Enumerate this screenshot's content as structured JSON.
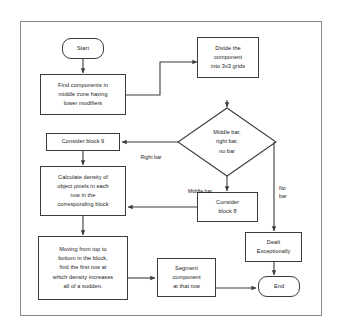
{
  "diagram": {
    "type": "flowchart",
    "border_color": "#8a8a8a",
    "node_border_color": "#3c3c3c",
    "background": "#ffffff",
    "nodes": {
      "start": {
        "label": "Start",
        "shape": "terminator"
      },
      "find_components": {
        "label": "Find components in\nmiddle zone having\nlower modifiers",
        "shape": "process"
      },
      "divide": {
        "label": "Divide the\ncomponent\ninto 3x3 grids",
        "shape": "process"
      },
      "decision": {
        "label": "Middle bar,\nright bar,\nno bar",
        "shape": "decision"
      },
      "consider_block_9": {
        "label": "Consider block 9",
        "shape": "process"
      },
      "calculate_density": {
        "label": "Calculate density of\nobject pixels in each\nrow in the\ncorresponding block",
        "shape": "process"
      },
      "consider_block_8": {
        "label": "Consider\nblock 8",
        "shape": "process"
      },
      "dealt_exceptionally": {
        "label": "Dealt\nExceptionally",
        "shape": "process"
      },
      "moving_top_bottom": {
        "label": "Moving from top to\nbottom in the block,\nfind the first row at\nwhich density increases\nall of a sudden.",
        "shape": "process"
      },
      "segment": {
        "label": "Segment\ncomponent\nat that row",
        "shape": "process"
      },
      "end": {
        "label": "End",
        "shape": "terminator"
      }
    },
    "edge_labels": {
      "right_bar": "Right bar",
      "middle_bar": "Middle bar",
      "no_bar": "No\nbar"
    }
  }
}
